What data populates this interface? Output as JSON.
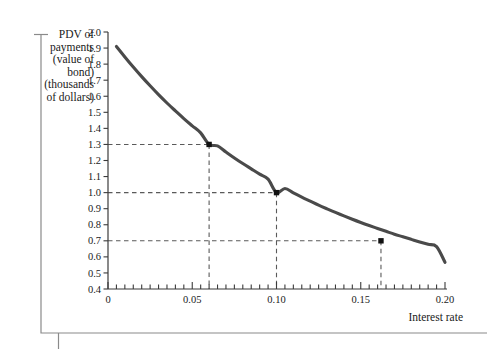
{
  "figure": {
    "background_color": "#ffffff",
    "curve_color": "#4a4a4a",
    "marker_color": "#111111",
    "dash_color": "#5a5a5a",
    "axis_color": "#3b3b3b",
    "border_color": "#8a8a8a"
  },
  "yaxis_title_lines": [
    "PDV of",
    "payments",
    "(value of",
    "bond)",
    "(thousands",
    "of dollars)"
  ],
  "chart_data": {
    "type": "line",
    "title": "",
    "subtitle": "",
    "xlabel": "Interest rate",
    "ylabel": "PDV of payments (value of bond) (thousands of dollars)",
    "xlim": [
      0,
      0.2
    ],
    "ylim": [
      0.4,
      2.0
    ],
    "grid": false,
    "legend": null,
    "x_major_ticks": [
      0,
      0.05,
      0.1,
      0.15,
      0.2
    ],
    "x_major_tick_labels": [
      "0",
      "0.05",
      "0.10",
      "0.15",
      "0.20"
    ],
    "x_minor_tick_step": 0.005,
    "y_major_ticks": [
      0.4,
      0.5,
      0.6,
      0.7,
      0.8,
      0.9,
      1.0,
      1.1,
      1.2,
      1.3,
      1.4,
      1.5,
      1.6,
      1.7,
      1.8,
      1.9,
      2.0
    ],
    "y_major_tick_labels": [
      "0.4",
      "0.5",
      "0.6",
      "0.7",
      "0.8",
      "0.9",
      "1.0",
      "1.1",
      "1.2",
      "1.3",
      "1.4",
      "1.5",
      "1.6",
      "1.7",
      "1.8",
      "1.9",
      "2.0"
    ],
    "series": [
      {
        "name": "PDV of bond payments",
        "x": [
          0.005,
          0.01,
          0.015,
          0.02,
          0.025,
          0.03,
          0.035,
          0.04,
          0.045,
          0.05,
          0.055,
          0.06,
          0.065,
          0.07,
          0.075,
          0.08,
          0.085,
          0.09,
          0.095,
          0.1,
          0.105,
          0.11,
          0.115,
          0.12,
          0.125,
          0.13,
          0.135,
          0.14,
          0.145,
          0.15,
          0.155,
          0.16,
          0.165,
          0.17,
          0.175,
          0.18,
          0.185,
          0.19,
          0.195,
          0.2
        ],
        "y": [
          1.91,
          1.845,
          1.782,
          1.722,
          1.665,
          1.61,
          1.558,
          1.509,
          1.461,
          1.416,
          1.372,
          1.3,
          1.291,
          1.253,
          1.216,
          1.181,
          1.148,
          1.115,
          1.084,
          1.0,
          1.026,
          0.998,
          0.972,
          0.947,
          0.922,
          0.899,
          0.877,
          0.855,
          0.834,
          0.814,
          0.795,
          0.777,
          0.759,
          0.741,
          0.725,
          0.709,
          0.693,
          0.678,
          0.664,
          0.566
        ]
      }
    ],
    "markers": [
      {
        "x": 0.06,
        "y": 1.3,
        "label": ""
      },
      {
        "x": 0.1,
        "y": 1.0,
        "label": ""
      },
      {
        "x": 0.162,
        "y": 0.7,
        "label": ""
      }
    ],
    "guide_lines": [
      {
        "from_y": 1.3,
        "to_x": 0.06,
        "style": "dashed"
      },
      {
        "from_y": 1.0,
        "to_x": 0.1,
        "style": "dashed"
      },
      {
        "from_y": 0.7,
        "to_x": 0.162,
        "style": "dashed"
      }
    ]
  }
}
